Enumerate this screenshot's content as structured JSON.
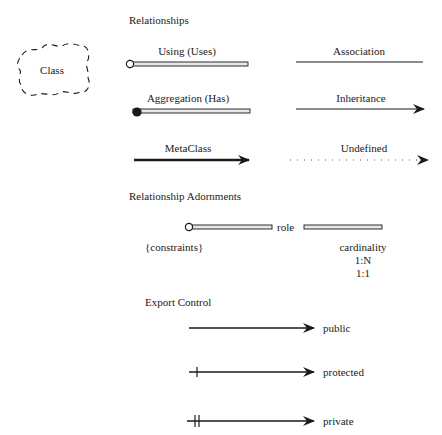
{
  "class_icon": {
    "label": "Class"
  },
  "relationships": {
    "heading": "Relationships",
    "items": [
      {
        "label": "Using (Uses)",
        "style": "double-line-open-circle"
      },
      {
        "label": "Association",
        "style": "plain-line"
      },
      {
        "label": "Aggregation (Has)",
        "style": "double-line-filled-circle"
      },
      {
        "label": "Inheritance",
        "style": "line-arrow"
      },
      {
        "label": "MetaClass",
        "style": "thick-line-arrow"
      },
      {
        "label": "Undefined",
        "style": "dotted-line-arrow"
      }
    ]
  },
  "adornments": {
    "heading": "Relationship Adornments",
    "role": "role",
    "constraints": "{constraints}",
    "cardinality": "cardinality",
    "cardinality_values": [
      "1:N",
      "1:1"
    ]
  },
  "export_control": {
    "heading": "Export Control",
    "items": [
      {
        "label": "public",
        "ticks": 0
      },
      {
        "label": "protected",
        "ticks": 1
      },
      {
        "label": "private",
        "ticks": 2
      }
    ]
  },
  "colors": {
    "ink": "#1a1a1a",
    "double_line_fill": "#e8e8e8",
    "background": "#ffffff"
  }
}
